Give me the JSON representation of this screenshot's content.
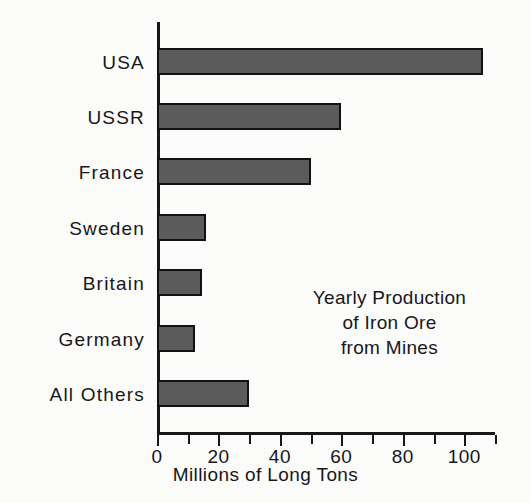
{
  "chart_data": {
    "type": "bar",
    "orientation": "horizontal",
    "title": "Yearly Production of Iron Ore from Mines",
    "annotation_lines": [
      "Yearly Production",
      "of Iron Ore",
      "from Mines"
    ],
    "categories": [
      "USA",
      "USSR",
      "France",
      "Sweden",
      "Britain",
      "Germany",
      "All Others"
    ],
    "values": [
      106,
      60,
      50,
      16,
      14.5,
      12.5,
      30
    ],
    "xlabel": "Millions of Long Tons",
    "ylabel": "",
    "xlim": [
      0,
      110
    ],
    "xticks": [
      0,
      10,
      20,
      30,
      40,
      50,
      60,
      70,
      80,
      90,
      100,
      110
    ],
    "xtick_labels": [
      "0",
      "",
      "20",
      "",
      "40",
      "",
      "60",
      "",
      "80",
      "",
      "100",
      ""
    ],
    "grid": false,
    "legend": null,
    "bar_fill_color": "#5b5b5c",
    "bar_edge_color": "#111113",
    "background_color": "#fbfbfa",
    "text_color": "#17171a"
  }
}
